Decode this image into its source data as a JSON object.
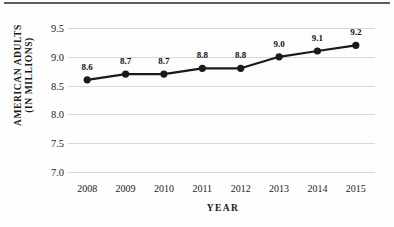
{
  "chart_data": {
    "type": "line",
    "title": "",
    "xlabel": "YEAR",
    "ylabel": "AMERICAN ADULTS (IN MILLIONS)",
    "ylabel_line1": "AMERICAN ADULTS",
    "ylabel_line2": "(IN MILLIONS)",
    "categories": [
      "2008",
      "2009",
      "2010",
      "2011",
      "2012",
      "2013",
      "2014",
      "2015"
    ],
    "values": [
      8.6,
      8.7,
      8.7,
      8.8,
      8.8,
      9.0,
      9.1,
      9.2
    ],
    "point_labels": [
      "8.6",
      "8.7",
      "8.7",
      "8.8",
      "8.8",
      "9.0",
      "9.1",
      "9.2"
    ],
    "ylim": [
      7.0,
      9.5
    ],
    "ytick_labels": [
      "7.0",
      "7.5",
      "8.0",
      "8.5",
      "9.0",
      "9.5"
    ],
    "ytick_values": [
      7.0,
      7.5,
      8.0,
      8.5,
      9.0,
      9.5
    ],
    "grid": "horizontal",
    "legend": "none",
    "series_color": "#1a1a1a",
    "grid_color": "#d8d8d8",
    "marker": "circle"
  }
}
